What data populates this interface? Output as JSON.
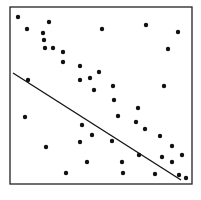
{
  "chart_data": {
    "type": "scatter",
    "title": "",
    "xlabel": "",
    "ylabel": "",
    "grid": false,
    "legend": null,
    "frame": {
      "x0": 10,
      "y0": 7,
      "x1": 192,
      "y1": 184,
      "color": "#222222"
    },
    "point_color": "#111111",
    "point_radius": 2.2,
    "points_pixel": [
      [
        18,
        17
      ],
      [
        27,
        29
      ],
      [
        49,
        22
      ],
      [
        43,
        33
      ],
      [
        44,
        40
      ],
      [
        45,
        48
      ],
      [
        53,
        48
      ],
      [
        63,
        52
      ],
      [
        63,
        62
      ],
      [
        80,
        66
      ],
      [
        80,
        80
      ],
      [
        90,
        78
      ],
      [
        99,
        72
      ],
      [
        94,
        90
      ],
      [
        28,
        80
      ],
      [
        102,
        29
      ],
      [
        146,
        25
      ],
      [
        178,
        32
      ],
      [
        168,
        49
      ],
      [
        113,
        86
      ],
      [
        164,
        86
      ],
      [
        114,
        100
      ],
      [
        25,
        117
      ],
      [
        82,
        125
      ],
      [
        92,
        135
      ],
      [
        80,
        142
      ],
      [
        46,
        147
      ],
      [
        87,
        162
      ],
      [
        66,
        173
      ],
      [
        138,
        108
      ],
      [
        118,
        116
      ],
      [
        136,
        122
      ],
      [
        145,
        129
      ],
      [
        160,
        136
      ],
      [
        112,
        141
      ],
      [
        172,
        146
      ],
      [
        182,
        155
      ],
      [
        139,
        155
      ],
      [
        162,
        157
      ],
      [
        172,
        162
      ],
      [
        122,
        162
      ],
      [
        123,
        173
      ],
      [
        155,
        174
      ],
      [
        179,
        175
      ],
      [
        186,
        178
      ]
    ],
    "fit_line_pixel": {
      "x1": 13,
      "y1": 73,
      "x2": 181,
      "y2": 180,
      "color": "#111111",
      "width": 1.3
    }
  }
}
